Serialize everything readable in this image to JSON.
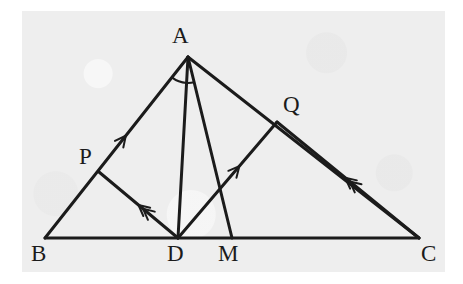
{
  "figure": {
    "kind": "geometry-diagram",
    "background_color": "#eeeeee",
    "page_color": "#ffffff",
    "ink_color": "#1b1b1b",
    "stroke_width": 3
  },
  "points": {
    "A": {
      "label": "A",
      "x": 188,
      "y": 57,
      "label_x": 172,
      "label_y": 24
    },
    "B": {
      "label": "B",
      "x": 45,
      "y": 238,
      "label_x": 31,
      "label_y": 242
    },
    "C": {
      "label": "C",
      "x": 419,
      "y": 238,
      "label_x": 421,
      "label_y": 242
    },
    "D": {
      "label": "D",
      "x": 178,
      "y": 238,
      "label_x": 167,
      "label_y": 242
    },
    "M": {
      "label": "M",
      "x": 232,
      "y": 238,
      "label_x": 218,
      "label_y": 242
    },
    "P": {
      "label": "P",
      "x": 99,
      "y": 172,
      "label_x": 79,
      "label_y": 145
    },
    "Q": {
      "label": "Q",
      "x": 277,
      "y": 122,
      "label_x": 283,
      "label_y": 93
    }
  },
  "segments": [
    {
      "name": "side-BA",
      "from": "B",
      "to": "A",
      "ticks": 1,
      "tick_direction": "toward-A",
      "tick_at": 0.565
    },
    {
      "name": "side-AC",
      "from": "A",
      "to": "C",
      "ticks": 0
    },
    {
      "name": "side-BC",
      "from": "B",
      "to": "C",
      "ticks": 0
    },
    {
      "name": "cevian-AD",
      "from": "A",
      "to": "D",
      "ticks": 0
    },
    {
      "name": "cevian-AM",
      "from": "A",
      "to": "M",
      "ticks": 0
    },
    {
      "name": "segment-PD",
      "from": "D",
      "to": "P",
      "ticks": 2,
      "tick_direction": "toward-P",
      "tick_at": 0.5
    },
    {
      "name": "segment-DQ",
      "from": "D",
      "to": "Q",
      "ticks": 1,
      "tick_direction": "toward-Q",
      "tick_at": 0.62
    },
    {
      "name": "segment-QC",
      "from": "C",
      "to": "Q",
      "ticks": 2,
      "tick_direction": "toward-Q",
      "tick_at": 0.52
    }
  ],
  "angle_marks": [
    {
      "name": "angle-BAD",
      "vertex": "A",
      "from": "B",
      "to": "D",
      "radius": 26
    },
    {
      "name": "angle-DAM",
      "vertex": "A",
      "from": "D",
      "to": "M",
      "radius": 26
    }
  ]
}
